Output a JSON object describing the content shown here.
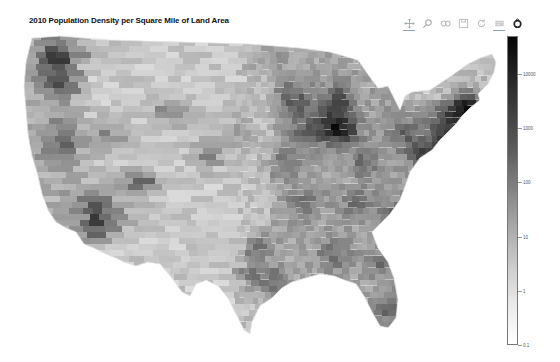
{
  "title": "2010 Population Density per Square Mile of Land Area",
  "toolbar": {
    "tools": [
      {
        "name": "pan",
        "icon": "pan-icon",
        "active": true
      },
      {
        "name": "wheel-zoom",
        "icon": "magnifier-icon",
        "active": false
      },
      {
        "name": "box-zoom",
        "icon": "box-zoom-icon",
        "active": false
      },
      {
        "name": "save",
        "icon": "save-icon",
        "active": false
      },
      {
        "name": "reset",
        "icon": "reset-icon",
        "active": false
      },
      {
        "name": "hover",
        "icon": "hover-icon",
        "active": true
      },
      {
        "name": "logo",
        "icon": "bokeh-logo-icon",
        "active": false
      }
    ]
  },
  "colorbar": {
    "scale": "log",
    "range": [
      0.1,
      50000
    ],
    "colormap": "greys (white = low, black = high)",
    "ticks": [
      {
        "value": 10000,
        "label": "10000"
      },
      {
        "value": 1000,
        "label": "1000"
      },
      {
        "value": 100,
        "label": "100"
      },
      {
        "value": 10,
        "label": "10"
      },
      {
        "value": 1,
        "label": "1"
      },
      {
        "value": 0.1,
        "label": "0.1"
      }
    ]
  },
  "map": {
    "region": "Contiguous United States by county",
    "metric": "Population density per square mile of land area (2010)",
    "hotspots": [
      {
        "name": "Seattle",
        "level": "high"
      },
      {
        "name": "Portland",
        "level": "high"
      },
      {
        "name": "San Francisco Bay Area",
        "level": "high"
      },
      {
        "name": "Los Angeles",
        "level": "very-high"
      },
      {
        "name": "Phoenix",
        "level": "high"
      },
      {
        "name": "Salt Lake City",
        "level": "high"
      },
      {
        "name": "Denver",
        "level": "high"
      },
      {
        "name": "Dallas",
        "level": "high"
      },
      {
        "name": "Houston",
        "level": "high"
      },
      {
        "name": "Chicago",
        "level": "very-high"
      },
      {
        "name": "Atlanta",
        "level": "high"
      },
      {
        "name": "Northeast corridor",
        "level": "very-high"
      },
      {
        "name": "Florida",
        "level": "medium-high"
      }
    ]
  }
}
